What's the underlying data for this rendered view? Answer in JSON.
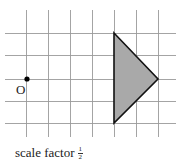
{
  "diagram": {
    "type": "enlargement-grid",
    "grid": {
      "vertical_x": [
        26,
        48,
        70,
        92,
        114,
        136,
        158
      ],
      "vertical_y_range": [
        10,
        137
      ],
      "horizontal_y": [
        33,
        55,
        79,
        101,
        123
      ],
      "horizontal_x_range": [
        5,
        176
      ],
      "line_color": "#9a9a9a"
    },
    "origin": {
      "label": "O",
      "x": 27,
      "y": 79,
      "color": "#000000"
    },
    "shape": {
      "name": "triangle",
      "points": "114,33 158,79 114,123",
      "fill": "#a9a9a9",
      "stroke": "#111111"
    }
  },
  "caption": {
    "text": "scale factor",
    "fraction_numerator": "1",
    "fraction_denominator": "2"
  }
}
